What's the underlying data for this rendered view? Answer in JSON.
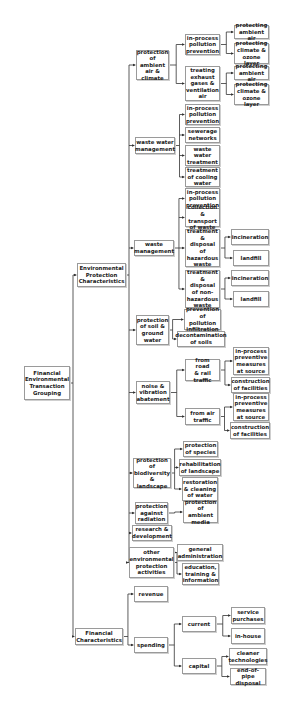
{
  "diagram": {
    "type": "tree",
    "root": "Financial Environmental Transaction Grouping",
    "nodes": [
      {
        "id": "root",
        "label": "Financial\nEnvironmental\nTransaction\nGrouping",
        "x": 24,
        "y": 366,
        "w": 46,
        "h": 34
      },
      {
        "id": "epc",
        "label": "Environmental\nProtection\nCharacteristics",
        "x": 77,
        "y": 263,
        "w": 49,
        "h": 24
      },
      {
        "id": "fc",
        "label": "Financial\nCharacteristics",
        "x": 75,
        "y": 628,
        "w": 48,
        "h": 17
      },
      {
        "id": "air",
        "label": "protection\nof ambient\nair &\nclimate",
        "x": 136,
        "y": 50,
        "w": 33,
        "h": 30
      },
      {
        "id": "air_ip",
        "label": "in-process\npollution\nprevention",
        "x": 185,
        "y": 34,
        "w": 35,
        "h": 21
      },
      {
        "id": "air_ip_a",
        "label": "protecting\nambient air",
        "x": 234,
        "y": 25,
        "w": 35,
        "h": 14
      },
      {
        "id": "air_ip_c",
        "label": "protecting\nclimate &\nozone layer",
        "x": 234,
        "y": 43,
        "w": 35,
        "h": 21
      },
      {
        "id": "air_te",
        "label": "treating\nexhaust\ngases &\nventilation\nair",
        "x": 185,
        "y": 66,
        "w": 35,
        "h": 35
      },
      {
        "id": "air_te_a",
        "label": "protecting\nambient air",
        "x": 234,
        "y": 66,
        "w": 35,
        "h": 14
      },
      {
        "id": "air_te_c",
        "label": "protecting\nclimate &\nozone layer",
        "x": 234,
        "y": 84,
        "w": 35,
        "h": 21
      },
      {
        "id": "ww",
        "label": "waste water\nmanagement",
        "x": 135,
        "y": 137,
        "w": 40,
        "h": 17
      },
      {
        "id": "ww_ip",
        "label": "in-process\npollution\nprevention",
        "x": 185,
        "y": 104,
        "w": 35,
        "h": 21
      },
      {
        "id": "ww_sn",
        "label": "sewerage\nnetworks",
        "x": 185,
        "y": 127,
        "w": 35,
        "h": 16
      },
      {
        "id": "ww_tr",
        "label": "waste\nwater\ntreatment",
        "x": 185,
        "y": 145,
        "w": 35,
        "h": 21
      },
      {
        "id": "ww_cw",
        "label": "treatment\nof cooling\nwater",
        "x": 185,
        "y": 167,
        "w": 35,
        "h": 20
      },
      {
        "id": "wm",
        "label": "waste\nmanagement",
        "x": 134,
        "y": 240,
        "w": 40,
        "h": 16
      },
      {
        "id": "wm_ip",
        "label": "in-process\npollution\nprevention",
        "x": 185,
        "y": 188,
        "w": 35,
        "h": 21
      },
      {
        "id": "wm_ct",
        "label": "collection\n& transport\nof waste",
        "x": 185,
        "y": 208,
        "w": 35,
        "h": 19
      },
      {
        "id": "wm_hz",
        "label": "treatment\n& disposal\nof\nhazardous\nwaste",
        "x": 185,
        "y": 229,
        "w": 35,
        "h": 38
      },
      {
        "id": "wm_hz_i",
        "label": "incineration",
        "x": 231,
        "y": 229,
        "w": 38,
        "h": 16
      },
      {
        "id": "wm_hz_l",
        "label": "landfill",
        "x": 233,
        "y": 250,
        "w": 36,
        "h": 16
      },
      {
        "id": "wm_nh",
        "label": "treatment\n& disposal\nof non-\nhazardous\nwaste",
        "x": 185,
        "y": 270,
        "w": 35,
        "h": 38
      },
      {
        "id": "wm_nh_i",
        "label": "incineration",
        "x": 231,
        "y": 270,
        "w": 38,
        "h": 16
      },
      {
        "id": "wm_nh_l",
        "label": "landfill",
        "x": 233,
        "y": 291,
        "w": 36,
        "h": 16
      },
      {
        "id": "soil",
        "label": "protection\nof soil &\nground\nwater",
        "x": 136,
        "y": 315,
        "w": 33,
        "h": 30
      },
      {
        "id": "soil_pi",
        "label": "prevention\nof pollution\ninfiltration",
        "x": 184,
        "y": 309,
        "w": 37,
        "h": 21
      },
      {
        "id": "soil_dc",
        "label": "decontamination\nof soils",
        "x": 177,
        "y": 331,
        "w": 48,
        "h": 16
      },
      {
        "id": "noise",
        "label": "noise &\nvibration\nabatement",
        "x": 136,
        "y": 381,
        "w": 34,
        "h": 23
      },
      {
        "id": "noise_rd",
        "label": "from road\n& rail\ntraffic",
        "x": 185,
        "y": 359,
        "w": 35,
        "h": 22
      },
      {
        "id": "noise_rd_ip",
        "label": "in-process\npreventive\nmeasures\nat source",
        "x": 233,
        "y": 347,
        "w": 36,
        "h": 28
      },
      {
        "id": "noise_rd_cf",
        "label": "construction\nof facilities",
        "x": 231,
        "y": 377,
        "w": 39,
        "h": 16
      },
      {
        "id": "noise_air",
        "label": "from air\ntraffic",
        "x": 185,
        "y": 408,
        "w": 35,
        "h": 17
      },
      {
        "id": "noise_air_ip",
        "label": "in-process\npreventive\nmeasures\nat source",
        "x": 233,
        "y": 393,
        "w": 36,
        "h": 28
      },
      {
        "id": "noise_air_cf",
        "label": "construction\nof facilities",
        "x": 230,
        "y": 422,
        "w": 40,
        "h": 17
      },
      {
        "id": "bio",
        "label": "protection\nof\nbiodiversity\n& landscape",
        "x": 133,
        "y": 458,
        "w": 38,
        "h": 30
      },
      {
        "id": "bio_sp",
        "label": "protection\nof species",
        "x": 183,
        "y": 441,
        "w": 35,
        "h": 16
      },
      {
        "id": "bio_rl",
        "label": "rehabilitation\nof landscape",
        "x": 179,
        "y": 459,
        "w": 42,
        "h": 17
      },
      {
        "id": "bio_rw",
        "label": "restoration\n& cleaning\nof water",
        "x": 182,
        "y": 477,
        "w": 36,
        "h": 24
      },
      {
        "id": "rad",
        "label": "protection\nagainst\nradiation",
        "x": 135,
        "y": 502,
        "w": 33,
        "h": 22
      },
      {
        "id": "rad_am",
        "label": "protection\nof ambient\nmedia",
        "x": 183,
        "y": 501,
        "w": 35,
        "h": 22
      },
      {
        "id": "rd",
        "label": "research &\ndevelopment",
        "x": 132,
        "y": 525,
        "w": 40,
        "h": 16
      },
      {
        "id": "oth",
        "label": "other\nenvironmental\nprotection\nactivities",
        "x": 129,
        "y": 547,
        "w": 45,
        "h": 31
      },
      {
        "id": "oth_ga",
        "label": "general\nadministration",
        "x": 177,
        "y": 544,
        "w": 46,
        "h": 17
      },
      {
        "id": "oth_et",
        "label": "education,\ntraining &\ninformation",
        "x": 182,
        "y": 563,
        "w": 37,
        "h": 22
      },
      {
        "id": "rev",
        "label": "revenue",
        "x": 134,
        "y": 586,
        "w": 34,
        "h": 16
      },
      {
        "id": "sp",
        "label": "spending",
        "x": 134,
        "y": 637,
        "w": 34,
        "h": 16
      },
      {
        "id": "cur",
        "label": "current",
        "x": 182,
        "y": 616,
        "w": 34,
        "h": 16
      },
      {
        "id": "cur_sv",
        "label": "service\npurchases",
        "x": 231,
        "y": 607,
        "w": 34,
        "h": 17
      },
      {
        "id": "cur_ih",
        "label": "in-house",
        "x": 231,
        "y": 628,
        "w": 34,
        "h": 16
      },
      {
        "id": "cap",
        "label": "capital",
        "x": 182,
        "y": 658,
        "w": 34,
        "h": 16
      },
      {
        "id": "cap_ct",
        "label": "cleaner\ntechnologies",
        "x": 229,
        "y": 648,
        "w": 38,
        "h": 17
      },
      {
        "id": "cap_ep",
        "label": "end-of-pipe\ndisposal",
        "x": 230,
        "y": 668,
        "w": 36,
        "h": 17
      }
    ],
    "edges": [
      [
        "root",
        "epc"
      ],
      [
        "root",
        "fc"
      ],
      [
        "epc",
        "air"
      ],
      [
        "epc",
        "ww"
      ],
      [
        "epc",
        "wm"
      ],
      [
        "epc",
        "soil"
      ],
      [
        "epc",
        "noise"
      ],
      [
        "epc",
        "bio"
      ],
      [
        "epc",
        "rad"
      ],
      [
        "epc",
        "rd"
      ],
      [
        "epc",
        "oth"
      ],
      [
        "air",
        "air_ip"
      ],
      [
        "air",
        "air_te"
      ],
      [
        "air_ip",
        "air_ip_a"
      ],
      [
        "air_ip",
        "air_ip_c"
      ],
      [
        "air_te",
        "air_te_a"
      ],
      [
        "air_te",
        "air_te_c"
      ],
      [
        "ww",
        "ww_ip"
      ],
      [
        "ww",
        "ww_sn"
      ],
      [
        "ww",
        "ww_tr"
      ],
      [
        "ww",
        "ww_cw"
      ],
      [
        "wm",
        "wm_ip"
      ],
      [
        "wm",
        "wm_ct"
      ],
      [
        "wm",
        "wm_hz"
      ],
      [
        "wm",
        "wm_nh"
      ],
      [
        "wm_hz",
        "wm_hz_i"
      ],
      [
        "wm_hz",
        "wm_hz_l"
      ],
      [
        "wm_nh",
        "wm_nh_i"
      ],
      [
        "wm_nh",
        "wm_nh_l"
      ],
      [
        "soil",
        "soil_pi"
      ],
      [
        "soil",
        "soil_dc"
      ],
      [
        "noise",
        "noise_rd"
      ],
      [
        "noise",
        "noise_air"
      ],
      [
        "noise_rd",
        "noise_rd_ip"
      ],
      [
        "noise_rd",
        "noise_rd_cf"
      ],
      [
        "noise_air",
        "noise_air_ip"
      ],
      [
        "noise_air",
        "noise_air_cf"
      ],
      [
        "bio",
        "bio_sp"
      ],
      [
        "bio",
        "bio_rl"
      ],
      [
        "bio",
        "bio_rw"
      ],
      [
        "rad",
        "rad_am"
      ],
      [
        "oth",
        "oth_ga"
      ],
      [
        "oth",
        "oth_et"
      ],
      [
        "fc",
        "rev"
      ],
      [
        "fc",
        "sp"
      ],
      [
        "sp",
        "cur"
      ],
      [
        "sp",
        "cap"
      ],
      [
        "cur",
        "cur_sv"
      ],
      [
        "cur",
        "cur_ih"
      ],
      [
        "cap",
        "cap_ct"
      ],
      [
        "cap",
        "cap_ep"
      ]
    ],
    "colors": {
      "line": "#333333",
      "border": "#9a9a9a",
      "text": "#222222",
      "background": "#ffffff"
    }
  }
}
